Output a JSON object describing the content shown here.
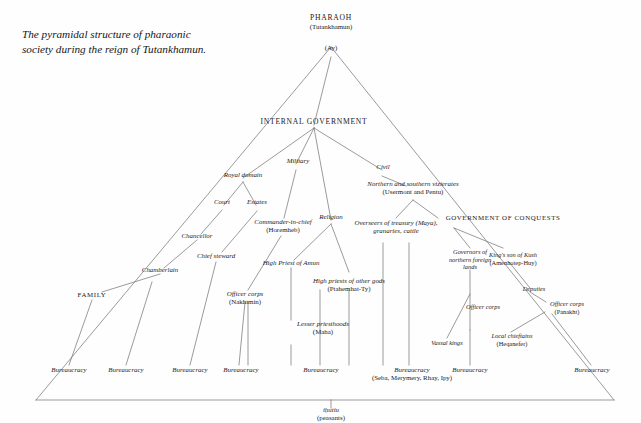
{
  "figure": {
    "caption": "The pyramidal structure of pharaonic society during the reign of Tutankhamun.",
    "line_color": "#6f6f6f",
    "text_color": "#1a1a1a",
    "background": "#fefefe"
  },
  "nodes": {
    "pharaoh": {
      "title": "PHARAOH",
      "holder": "(Tutankhamun)"
    },
    "ay": {
      "title": "(Ay)"
    },
    "internal_government": {
      "title": "INTERNAL GOVERNMENT"
    },
    "royal_domain": {
      "title": "Royal domain"
    },
    "military": {
      "title": "Military"
    },
    "religion": {
      "title": "Religion"
    },
    "civil": {
      "title": "Civil"
    },
    "court": {
      "title": "Court"
    },
    "estates": {
      "title": "Estates"
    },
    "chancellor": {
      "title": "Chancellor"
    },
    "chief_steward": {
      "title": "Chief steward"
    },
    "chamberlain": {
      "title": "Chamberlain"
    },
    "family": {
      "title": "FAMILY"
    },
    "commander_in_chief": {
      "title": "Commander-in-chief",
      "holder": "(Horemheb)"
    },
    "officer_corps_military": {
      "title": "Officer corps",
      "holder": "(Nakhtmin)"
    },
    "high_priest_amun": {
      "title": "High Priest of Amun"
    },
    "high_priests_other_gods": {
      "title": "High priests of other gods",
      "holder": "(Ptahemhat-Ty)"
    },
    "lesser_priesthoods": {
      "title": "Lesser priesthoods",
      "holder": "(Maha)"
    },
    "vizierates": {
      "title": "Northern and southern vizierates",
      "holder": "(Usermont and Pentu)"
    },
    "overseers_treasury": {
      "title": "Overseers of treasury (Maya),",
      "holder": "granaries, cattle"
    },
    "government_of_conquests": {
      "title": "GOVERNMENT OF CONQUESTS"
    },
    "governors_northern": {
      "title": "Governors of northern foreign lands"
    },
    "kings_son_of_kush": {
      "title": "King's son of Kush",
      "holder": "(Amenhotep-Huy)"
    },
    "officer_corps_north": {
      "title": "Officer corps"
    },
    "deputies": {
      "title": "Deputies"
    },
    "officer_corps_kush": {
      "title": "Officer corps",
      "holder": "(Panakht)"
    },
    "vassal_kings": {
      "title": "Vassal kings"
    },
    "local_chieftains": {
      "title": "Local chieftains",
      "holder": "(Heqanefer)"
    },
    "peasants": {
      "title": "iḥutiu",
      "holder": "(peasants)"
    }
  },
  "bureaucracies": [
    {
      "id": "bureaucracy_family",
      "title": "Bureaucracy"
    },
    {
      "id": "bureaucracy_chamberlain",
      "title": "Bureaucracy"
    },
    {
      "id": "bureaucracy_chief_steward",
      "title": "Bureaucracy"
    },
    {
      "id": "bureaucracy_chancellor",
      "title": "Bureaucracy"
    },
    {
      "id": "bureaucracy_military",
      "title": "Bureaucracy"
    },
    {
      "id": "bureaucracy_religion",
      "title": "Bureaucracy",
      "holder": "(Seba, Merymery, Rhay, Ipy)"
    },
    {
      "id": "bureaucracy_civil",
      "title": "Bureaucracy"
    },
    {
      "id": "bureaucracy_conquests",
      "title": "Bureaucracy"
    }
  ]
}
